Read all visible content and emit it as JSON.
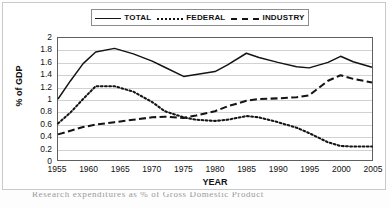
{
  "figure": {
    "caption": "Research expenditures as % of Gross Domestic Product"
  },
  "chart_data": {
    "type": "line",
    "title": "",
    "xlabel": "YEAR",
    "ylabel": "% of GDP",
    "xlim": [
      1955,
      2005
    ],
    "ylim": [
      0,
      2
    ],
    "grid": true,
    "legend_position": "top",
    "x_ticks": [
      "1955",
      "1960",
      "1965",
      "1970",
      "1975",
      "1980",
      "1985",
      "1990",
      "1995",
      "2000",
      "2005"
    ],
    "y_ticks": [
      "2",
      "1.8",
      "1.6",
      "1.4",
      "1.2",
      "1",
      "0.8",
      "0.6",
      "0.4",
      "0.2",
      "0"
    ],
    "x": [
      1955,
      1957,
      1959,
      1961,
      1964,
      1967,
      1970,
      1972,
      1975,
      1977,
      1980,
      1982,
      1985,
      1987,
      1990,
      1993,
      1995,
      1998,
      2000,
      2002,
      2005
    ],
    "series": [
      {
        "name": "TOTAL",
        "style": "solid",
        "color": "#141414",
        "values": [
          1.0,
          1.3,
          1.58,
          1.77,
          1.83,
          1.74,
          1.62,
          1.52,
          1.37,
          1.4,
          1.45,
          1.56,
          1.75,
          1.68,
          1.6,
          1.53,
          1.51,
          1.6,
          1.7,
          1.61,
          1.52
        ]
      },
      {
        "name": "FEDERAL",
        "style": "dotted",
        "color": "#141414",
        "values": [
          0.6,
          0.78,
          1.0,
          1.21,
          1.21,
          1.12,
          0.95,
          0.8,
          0.7,
          0.66,
          0.64,
          0.66,
          0.72,
          0.7,
          0.62,
          0.53,
          0.44,
          0.29,
          0.23,
          0.22,
          0.22
        ]
      },
      {
        "name": "INDUSTRY",
        "style": "dashed",
        "color": "#141414",
        "values": [
          0.42,
          0.48,
          0.54,
          0.58,
          0.62,
          0.66,
          0.7,
          0.71,
          0.69,
          0.73,
          0.8,
          0.88,
          0.97,
          1.0,
          1.01,
          1.03,
          1.06,
          1.3,
          1.39,
          1.33,
          1.27
        ]
      }
    ]
  },
  "legend": {
    "entries": [
      {
        "label": "TOTAL",
        "style": "solid"
      },
      {
        "label": "FEDERAL",
        "style": "dotted"
      },
      {
        "label": "INDUSTRY",
        "style": "dashed"
      }
    ]
  }
}
